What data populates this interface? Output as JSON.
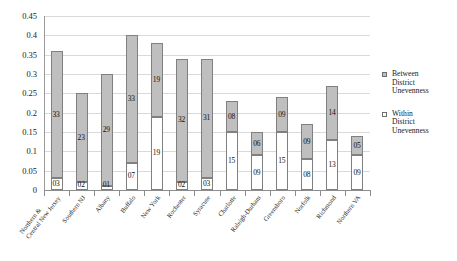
{
  "chart_data": {
    "type": "bar",
    "subtype": "stacked-column",
    "title": "",
    "xlabel": "",
    "ylabel": "",
    "ylim": [
      0,
      0.45
    ],
    "ytick_step": 0.05,
    "ytick_labels": [
      "0",
      "0.05",
      "0.1",
      "0.15",
      "0.2",
      "0.25",
      "0.3",
      "0.35",
      "0.4",
      "0.45"
    ],
    "grid": "horizontal",
    "legend_position": "right",
    "categories": [
      "Northern & Central New Jersey",
      "Southern NJ",
      "Albany",
      "Buffalo",
      "New York",
      "Rochester",
      "Syracuse",
      "Charlotte",
      "Raleigh-Durham",
      "Greensboro",
      "Norfolk",
      "Richmond",
      "Northern VA"
    ],
    "category_lines": [
      [
        "Northern &",
        "Central New Jersey"
      ],
      [
        "Southern NJ"
      ],
      [
        "Albany"
      ],
      [
        "Buffalo"
      ],
      [
        "New York"
      ],
      [
        "Rochester"
      ],
      [
        "Syracuse"
      ],
      [
        "Charlotte"
      ],
      [
        "Raleigh-Durham"
      ],
      [
        "Greensboro"
      ],
      [
        "Norfolk"
      ],
      [
        "Richmond"
      ],
      [
        "Northern VA"
      ]
    ],
    "series": [
      {
        "name": "Within District Unevenness",
        "key": "within",
        "color": "#ffffff",
        "stack_order": 0,
        "values": [
          0.03,
          0.02,
          0.01,
          0.07,
          0.19,
          0.02,
          0.03,
          0.15,
          0.09,
          0.15,
          0.08,
          0.13,
          0.09
        ],
        "labels": [
          "03",
          "02",
          "01",
          "07",
          "19",
          "02",
          "03",
          "15",
          "09",
          "15",
          "08",
          "13",
          "09"
        ]
      },
      {
        "name": "Between District Unevenness",
        "key": "between",
        "color": "#bfbfbf",
        "stack_order": 1,
        "values": [
          0.33,
          0.23,
          0.29,
          0.33,
          0.19,
          0.32,
          0.31,
          0.08,
          0.06,
          0.09,
          0.09,
          0.14,
          0.05
        ],
        "labels": [
          "33",
          "23",
          "29",
          "33",
          "19",
          "32",
          "31",
          "08",
          "06",
          "09",
          "09",
          "14",
          "05"
        ]
      }
    ],
    "totals": [
      0.36,
      0.25,
      0.3,
      0.4,
      0.38,
      0.34,
      0.34,
      0.23,
      0.15,
      0.24,
      0.17,
      0.27,
      0.14
    ]
  },
  "legend": {
    "items": [
      {
        "key": "between",
        "lines": [
          "Between",
          "District",
          "Unevenness"
        ]
      },
      {
        "key": "within",
        "lines": [
          "Within",
          "District",
          "Unevenness"
        ]
      }
    ]
  },
  "colors": {
    "between_fill": "#bfbfbf",
    "within_fill": "#ffffff",
    "bar_border": "#808080",
    "gridline": "#d9d9d9",
    "axis": "#8d8d8d",
    "text": "#1a1a1a"
  }
}
